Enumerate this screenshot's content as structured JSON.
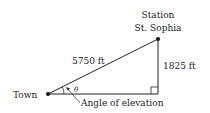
{
  "diagram": {
    "type": "right-triangle",
    "labels": {
      "station_line1": "Station",
      "station_line2": "St. Sophia",
      "hypotenuse": "5750 ft",
      "vertical_side": "1825 ft",
      "town": "Town",
      "angle_symbol": "θ",
      "angle_caption": "Angle of elevation"
    },
    "colors": {
      "line": "#222222",
      "text": "#222222",
      "background": "#ffffff"
    }
  }
}
